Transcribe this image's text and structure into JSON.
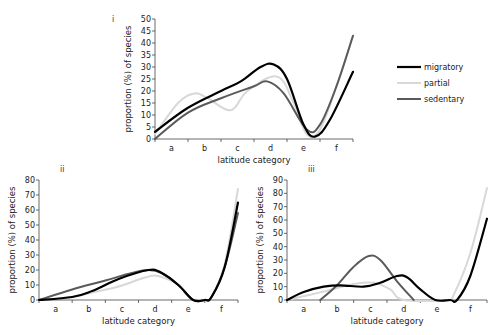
{
  "legend": {
    "items": [
      {
        "label": "migratory",
        "color": "#000000",
        "width": 2.2
      },
      {
        "label": "partial",
        "color": "#d8d8d8",
        "width": 2.0
      },
      {
        "label": "sedentary",
        "color": "#5a5a5a",
        "width": 2.0
      }
    ]
  },
  "chart_data": [
    {
      "panel": "i",
      "type": "line",
      "title": "",
      "xlabel": "latitude category",
      "ylabel": "proportion (%) of species",
      "categories": [
        "a",
        "b",
        "c",
        "d",
        "e",
        "f"
      ],
      "ylim": [
        0,
        50
      ],
      "yticks": [
        0,
        5,
        10,
        15,
        20,
        25,
        30,
        35,
        40,
        45,
        50
      ],
      "grid": false,
      "legend_position": "right",
      "series": [
        {
          "name": "migratory",
          "points": [
            [
              0,
              3
            ],
            [
              1,
              13
            ],
            [
              2,
              20
            ],
            [
              2.6,
              24
            ],
            [
              3.2,
              30
            ],
            [
              3.6,
              31
            ],
            [
              4.0,
              25
            ],
            [
              4.5,
              6
            ],
            [
              4.85,
              1
            ],
            [
              5.3,
              8
            ],
            [
              6,
              28
            ]
          ]
        },
        {
          "name": "partial",
          "points": [
            [
              0,
              2
            ],
            [
              0.7,
              15
            ],
            [
              1.2,
              19
            ],
            [
              1.6,
              17
            ],
            [
              2.3,
              12
            ],
            [
              2.8,
              20
            ],
            [
              3.7,
              26
            ],
            [
              4.2,
              15
            ],
            [
              4.6,
              2
            ],
            [
              5.0,
              4
            ],
            [
              5.5,
              22
            ],
            [
              6,
              43
            ]
          ]
        },
        {
          "name": "sedentary",
          "points": [
            [
              0,
              0
            ],
            [
              1,
              11
            ],
            [
              2,
              17
            ],
            [
              3.0,
              22
            ],
            [
              3.4,
              24
            ],
            [
              3.9,
              19
            ],
            [
              4.6,
              4
            ],
            [
              5.0,
              6
            ],
            [
              5.5,
              22
            ],
            [
              6,
              43
            ]
          ]
        }
      ]
    },
    {
      "panel": "ii",
      "type": "line",
      "title": "",
      "xlabel": "latitude category",
      "ylabel": "proportion (%) of species",
      "categories": [
        "a",
        "b",
        "c",
        "d",
        "e",
        "f"
      ],
      "ylim": [
        0,
        80
      ],
      "yticks": [
        0,
        10,
        20,
        30,
        40,
        50,
        60,
        70,
        80
      ],
      "grid": false,
      "series": [
        {
          "name": "migratory",
          "points": [
            [
              0,
              0
            ],
            [
              1,
              2
            ],
            [
              1.6,
              6
            ],
            [
              2.4,
              14
            ],
            [
              3.3,
              20
            ],
            [
              3.7,
              18
            ],
            [
              4.2,
              10
            ],
            [
              4.65,
              0
            ],
            [
              5.0,
              0
            ],
            [
              5.2,
              2
            ],
            [
              5.6,
              22
            ],
            [
              6,
              65
            ]
          ]
        },
        {
          "name": "partial",
          "points": [
            [
              0,
              0
            ],
            [
              1,
              2
            ],
            [
              1.6,
              5
            ],
            [
              2.4,
              9
            ],
            [
              3.2,
              15
            ],
            [
              3.6,
              16
            ],
            [
              4.2,
              10
            ],
            [
              4.65,
              0
            ],
            [
              5.0,
              0
            ],
            [
              5.2,
              2
            ],
            [
              5.6,
              24
            ],
            [
              6,
              74
            ]
          ]
        },
        {
          "name": "sedentary",
          "points": [
            [
              0,
              0
            ],
            [
              1,
              7
            ],
            [
              2,
              13
            ],
            [
              2.8,
              18
            ],
            [
              3.3,
              20
            ],
            [
              3.7,
              18
            ],
            [
              4.2,
              10
            ],
            [
              4.65,
              0
            ],
            [
              5.0,
              0
            ],
            [
              5.2,
              2
            ],
            [
              5.6,
              22
            ],
            [
              6,
              58
            ]
          ]
        }
      ]
    },
    {
      "panel": "iii",
      "type": "line",
      "title": "",
      "xlabel": "latitude category",
      "ylabel": "proportion (%) of species",
      "categories": [
        "a",
        "b",
        "c",
        "d",
        "e",
        "f"
      ],
      "ylim": [
        0,
        90
      ],
      "yticks": [
        0,
        10,
        20,
        30,
        40,
        50,
        60,
        70,
        80,
        90
      ],
      "grid": false,
      "series": [
        {
          "name": "migratory",
          "points": [
            [
              0,
              0
            ],
            [
              0.5,
              6
            ],
            [
              1.1,
              10
            ],
            [
              1.6,
              11
            ],
            [
              2.3,
              10
            ],
            [
              2.8,
              13
            ],
            [
              3.3,
              18
            ],
            [
              3.6,
              17
            ],
            [
              4.0,
              8
            ],
            [
              4.45,
              0
            ],
            [
              4.9,
              0
            ],
            [
              5.1,
              0
            ],
            [
              5.5,
              18
            ],
            [
              6,
              61
            ]
          ]
        },
        {
          "name": "partial",
          "points": [
            [
              0,
              0
            ],
            [
              0.7,
              4
            ],
            [
              1.2,
              7
            ],
            [
              2.0,
              12
            ],
            [
              2.6,
              13
            ],
            [
              3.1,
              8
            ],
            [
              3.5,
              0
            ],
            [
              4.8,
              0
            ],
            [
              5.0,
              4
            ],
            [
              5.5,
              35
            ],
            [
              6,
              84
            ]
          ]
        },
        {
          "name": "sedentary",
          "points": [
            [
              1.0,
              0
            ],
            [
              1.5,
              11
            ],
            [
              2.0,
              25
            ],
            [
              2.45,
              33
            ],
            [
              2.8,
              30
            ],
            [
              3.3,
              14
            ],
            [
              3.8,
              0
            ]
          ]
        }
      ]
    }
  ]
}
